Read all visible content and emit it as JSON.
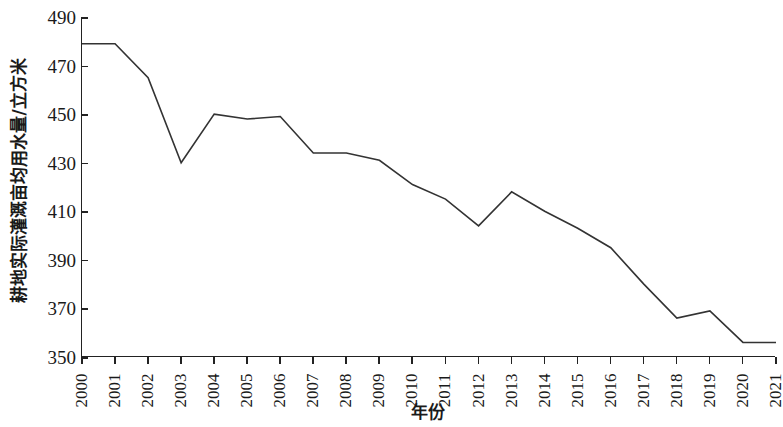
{
  "chart_data": {
    "type": "line",
    "title": "",
    "subtitle": "",
    "xlabel": "年份",
    "ylabel": "耕地实际灌溉亩均用水量/立方米",
    "x": [
      2000,
      2001,
      2002,
      2003,
      2004,
      2005,
      2006,
      2007,
      2008,
      2009,
      2010,
      2011,
      2012,
      2013,
      2014,
      2015,
      2016,
      2017,
      2018,
      2019,
      2020,
      2021
    ],
    "categories": [
      "2000",
      "2001",
      "2002",
      "2003",
      "2004",
      "2005",
      "2006",
      "2007",
      "2008",
      "2009",
      "2010",
      "2011",
      "2012",
      "2013",
      "2014",
      "2015",
      "2016",
      "2017",
      "2018",
      "2019",
      "2020",
      "2021"
    ],
    "values": [
      479,
      479,
      465,
      430,
      450,
      448,
      449,
      434,
      434,
      431,
      421,
      415,
      404,
      418,
      410,
      403,
      395,
      380,
      366,
      369,
      356,
      356
    ],
    "series": [
      {
        "name": "耕地实际灌溉亩均用水量",
        "values": [
          479,
          479,
          465,
          430,
          450,
          448,
          449,
          434,
          434,
          431,
          421,
          415,
          404,
          418,
          410,
          403,
          395,
          380,
          366,
          369,
          356,
          356
        ],
        "color": "#333333"
      }
    ],
    "xlim": [
      2000,
      2021
    ],
    "ylim": [
      350,
      490
    ],
    "yticks": [
      350,
      370,
      390,
      410,
      430,
      450,
      470,
      490
    ],
    "ytick_labels": [
      "350",
      "370",
      "390",
      "410",
      "430",
      "450",
      "470",
      "490"
    ],
    "xtick_labels": [
      "2000",
      "2001",
      "2002",
      "2003",
      "2004",
      "2005",
      "2006",
      "2007",
      "2008",
      "2009",
      "2010",
      "2011",
      "2012",
      "2013",
      "2014",
      "2015",
      "2016",
      "2017",
      "2018",
      "2019",
      "2020",
      "2021"
    ],
    "grid": false,
    "legend": false,
    "legend_position": "none",
    "line_color": "#333333",
    "line_width": 1.6,
    "markers": false,
    "axis_color": "#222222",
    "background": "#ffffff",
    "annotations": []
  }
}
